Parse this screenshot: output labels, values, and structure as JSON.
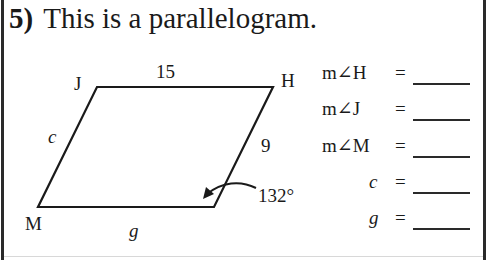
{
  "problem": {
    "number": "5)",
    "statement": "This is a parallelogram."
  },
  "diagram": {
    "shape": "parallelogram",
    "vertices": {
      "J": {
        "label": "J",
        "x": 97,
        "y": 87
      },
      "H": {
        "label": "H",
        "x": 273,
        "y": 87
      },
      "bottom_right": {
        "label": "",
        "x": 214,
        "y": 207
      },
      "M": {
        "label": "M",
        "x": 38,
        "y": 207
      }
    },
    "side_labels": {
      "JH": "15",
      "JM": "c",
      "H_bottom_right": "9",
      "M_bottom_right": "g"
    },
    "angle_label": "132°",
    "stroke_color": "#1a1a1a"
  },
  "answers": [
    {
      "label": "m∠H",
      "equals": "=",
      "value": "",
      "italic": false
    },
    {
      "label": "m∠J",
      "equals": "=",
      "value": "",
      "italic": false
    },
    {
      "label": "m∠M",
      "equals": "=",
      "value": "",
      "italic": false
    },
    {
      "label": "c",
      "equals": "=",
      "value": "",
      "italic": true
    },
    {
      "label": "g",
      "equals": "=",
      "value": "",
      "italic": true
    }
  ]
}
